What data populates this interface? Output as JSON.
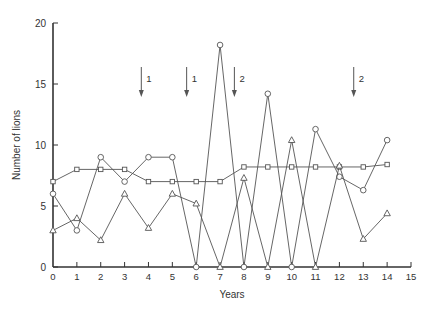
{
  "chart_data": {
    "type": "line",
    "title": "",
    "xlabel": "Years",
    "ylabel": "Number of lions",
    "xlim": [
      0,
      15
    ],
    "ylim": [
      0,
      20
    ],
    "x_ticks": [
      0,
      1,
      2,
      3,
      4,
      5,
      6,
      7,
      8,
      9,
      10,
      11,
      12,
      13,
      14,
      15
    ],
    "y_ticks": [
      0,
      5,
      10,
      15,
      20
    ],
    "grid": false,
    "legend": null,
    "x": [
      0,
      1,
      2,
      3,
      4,
      5,
      6,
      7,
      8,
      9,
      10,
      11,
      12,
      13,
      14
    ],
    "series": [
      {
        "name": "squares",
        "marker": "square",
        "values": [
          7,
          8,
          8,
          8,
          7,
          7,
          7,
          7,
          8.2,
          8.2,
          8.2,
          8.2,
          8.2,
          8.2,
          8.4
        ]
      },
      {
        "name": "circles",
        "marker": "circle",
        "values": [
          6,
          3,
          9,
          7,
          9,
          9,
          0,
          18.2,
          0,
          14.2,
          0,
          11.3,
          7.4,
          6.3,
          10.4
        ]
      },
      {
        "name": "triangles",
        "marker": "triangle",
        "values": [
          3,
          4,
          2.2,
          6,
          3.2,
          6,
          5.2,
          0,
          7.3,
          0,
          10.4,
          0,
          8.3,
          2.3,
          4.4
        ]
      }
    ],
    "annotations": [
      {
        "type": "arrow-down",
        "x": 3.7,
        "label": "1"
      },
      {
        "type": "arrow-down",
        "x": 5.6,
        "label": "1"
      },
      {
        "type": "arrow-down",
        "x": 7.6,
        "label": "2"
      },
      {
        "type": "arrow-down",
        "x": 12.6,
        "label": "2"
      }
    ]
  },
  "colors": {
    "line": "#555555",
    "axis": "#333333",
    "marker_fill": "#ffffff"
  }
}
